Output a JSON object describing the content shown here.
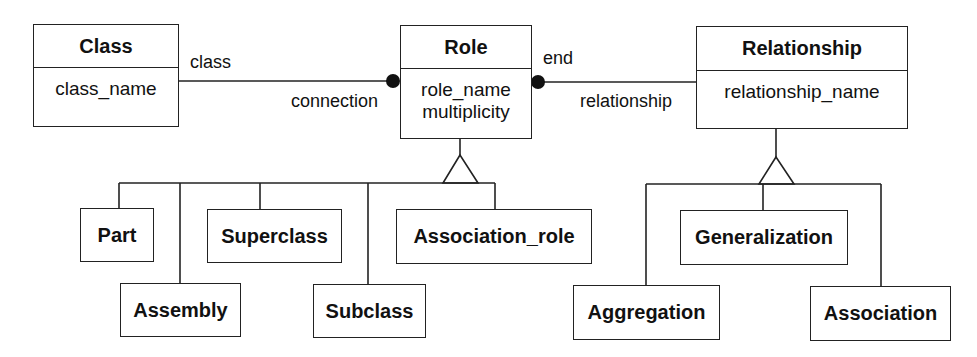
{
  "diagram": {
    "type": "UML class diagram (metamodel)",
    "classes": {
      "class": {
        "name": "Class",
        "attributes": [
          "class_name"
        ]
      },
      "role": {
        "name": "Role",
        "attributes": [
          "role_name",
          "multiplicity"
        ]
      },
      "relationship": {
        "name": "Relationship",
        "attributes": [
          "relationship_name"
        ]
      }
    },
    "associations": [
      {
        "from": "Class",
        "to": "Role",
        "from_label": "class",
        "to_label": "connection",
        "to_end": "filled-dot"
      },
      {
        "from": "Role",
        "to": "Relationship",
        "from_label": "end",
        "to_label": "relationship",
        "from_end": "filled-dot"
      }
    ],
    "role_subclasses": [
      "Part",
      "Assembly",
      "Superclass",
      "Subclass",
      "Association_role"
    ],
    "relationship_subclasses": [
      "Aggregation",
      "Generalization",
      "Association"
    ],
    "labels": {
      "class_end": "class",
      "connection_end": "connection",
      "end_end": "end",
      "relationship_end": "relationship"
    },
    "colors": {
      "line": "#222222",
      "background": "#ffffff",
      "text": "#111111"
    }
  }
}
